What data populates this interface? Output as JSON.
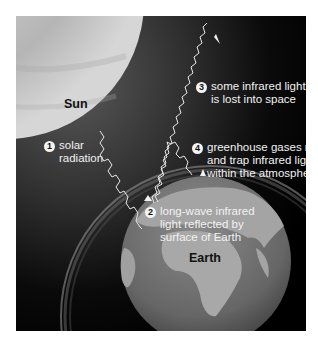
{
  "diagram": {
    "bodies": {
      "sun": {
        "label": "Sun",
        "color": "#c8c8c8"
      },
      "earth": {
        "label": "Earth",
        "ocean_color": "#6e6e6e",
        "land_color": "#a8a8a8"
      }
    },
    "steps": [
      {
        "number": "1",
        "lines": [
          "solar",
          "radiation"
        ]
      },
      {
        "number": "2",
        "lines": [
          "long-wave infrared",
          "light reflected by",
          "surface of Earth"
        ]
      },
      {
        "number": "3",
        "lines": [
          "some infrared light",
          "is lost into  space"
        ]
      },
      {
        "number": "4",
        "lines": [
          "greenhouse gases reflect",
          "and trap infrared light",
          "within the atmosphere"
        ]
      }
    ],
    "colors": {
      "background": "#000000",
      "arrow": "#e8e8e8",
      "text": "#f2f2f2",
      "atmosphere": "#8a8a8a"
    }
  }
}
